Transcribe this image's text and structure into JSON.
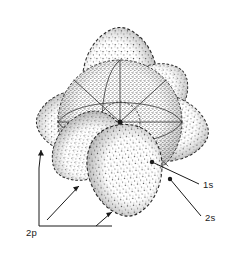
{
  "figure": {
    "background_color": "#ffffff",
    "ink_color": "#1a1a1a",
    "stipple_color": "#4a4a4a"
  },
  "labels": [
    {
      "id": "label-1s",
      "text": "1s",
      "x": 203,
      "y": 188,
      "leader_from": {
        "x": 199,
        "y": 184
      },
      "leader_to": {
        "x": 152,
        "y": 162
      },
      "anchor_dot": {
        "x": 152,
        "y": 162
      }
    },
    {
      "id": "label-2s",
      "text": "2s",
      "x": 205,
      "y": 221,
      "leader_from": {
        "x": 201,
        "y": 216
      },
      "leader_to": {
        "x": 170,
        "y": 179
      },
      "anchor_dot": {
        "x": 170,
        "y": 179
      }
    },
    {
      "id": "label-2p",
      "text": "2p",
      "x": 26,
      "y": 236,
      "bracket": {
        "stem_x": 39,
        "stem_top": 168,
        "stem_bottom": 226,
        "rail_y": 226,
        "rail_right": 112
      },
      "arrows": [
        {
          "x": 41,
          "y": 150
        },
        {
          "x": 79,
          "y": 186
        },
        {
          "x": 112,
          "y": 212
        }
      ]
    }
  ],
  "orbitals": {
    "core": {
      "name": "1s",
      "type": "sphere",
      "center": {
        "x": 120,
        "y": 122
      },
      "radius": 20
    },
    "valence_s": {
      "name": "2s",
      "type": "sphere",
      "center": {
        "x": 120,
        "y": 122
      },
      "radius": 62
    },
    "p_lobes": {
      "name": "2p",
      "type": "lobes",
      "count": 6,
      "orientations": [
        {
          "axis": "z-up",
          "angle_deg": -90,
          "cx": 122,
          "cy": 52,
          "rx": 30,
          "ry": 40
        },
        {
          "axis": "z-down",
          "angle_deg": 90,
          "cx": 134,
          "cy": 208,
          "rx": 30,
          "ry": 40
        },
        {
          "axis": "x-left",
          "angle_deg": 180,
          "cx": 45,
          "cy": 126,
          "rx": 40,
          "ry": 31
        },
        {
          "axis": "x-right",
          "angle_deg": 0,
          "cx": 198,
          "cy": 136,
          "rx": 40,
          "ry": 31
        },
        {
          "axis": "y-back",
          "angle_deg": -35,
          "cx": 176,
          "cy": 79,
          "rx": 38,
          "ry": 28
        },
        {
          "axis": "y-front",
          "angle_deg": 145,
          "cx": 72,
          "cy": 178,
          "rx": 38,
          "ry": 28
        }
      ]
    }
  }
}
